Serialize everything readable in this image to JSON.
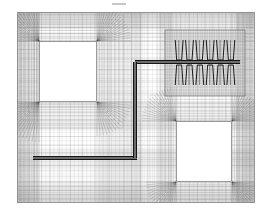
{
  "figure": {
    "name": "finite-element-mesh-view",
    "title": "",
    "width": 272,
    "height": 215,
    "background_color": "#ffffff",
    "artifact_mark": {
      "label": "",
      "x": 112,
      "y": 3,
      "width": 14,
      "height": 2,
      "color": "#b8b8b8"
    }
  },
  "domain": {
    "name": "mesh-domain-outline",
    "x": 17,
    "y": 12,
    "width": 238,
    "height": 191,
    "border_color": "#8a8a8a",
    "fill_color": "#ffffff"
  },
  "mesh": {
    "line_color": "#555555",
    "line_color_light": "#9a9a9a",
    "line_width": 0.35,
    "background_grid": {
      "columns": 58,
      "rows": 46,
      "color": "#aaaaaa"
    },
    "radial_fan_color": "#4a4a4a",
    "description": "structured quadrilateral mesh with graded refinement toward square voids and embedded bar/coil features"
  },
  "holes": [
    {
      "name": "upper-left-square-void",
      "x": 39,
      "y": 41,
      "width": 58,
      "height": 61,
      "fill_color": "#ffffff",
      "border_color": "#6f6f6f"
    },
    {
      "name": "lower-right-square-void",
      "x": 176,
      "y": 121,
      "width": 56,
      "height": 61,
      "fill_color": "#ffffff",
      "border_color": "#6f6f6f"
    }
  ],
  "bars": [
    {
      "name": "upper-horizontal-bar",
      "x1": 135,
      "y1": 62,
      "x2": 240,
      "y2": 62,
      "thickness": 4,
      "color": "#151515"
    },
    {
      "name": "lower-horizontal-bar",
      "x1": 33,
      "y1": 158,
      "x2": 137,
      "y2": 158,
      "thickness": 4,
      "color": "#151515"
    },
    {
      "name": "vertical-connector-bar",
      "x1": 135,
      "y1": 62,
      "x2": 135,
      "y2": 158,
      "thickness": 4,
      "color": "#151515"
    }
  ],
  "coil_block": {
    "name": "coil-housing-block",
    "x": 165,
    "y": 30,
    "width": 80,
    "height": 66,
    "shade_color": "#c9c9c9",
    "border_color": "#5a5a5a",
    "teeth_count": 6,
    "tooth_color": "#1c1c1c",
    "upper_band": {
      "y": 40,
      "height": 20
    },
    "lower_band": {
      "y": 65,
      "height": 20
    }
  },
  "legend": {
    "items": []
  }
}
